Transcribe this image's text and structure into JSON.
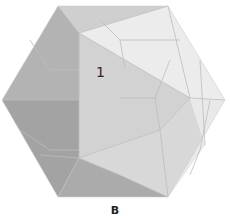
{
  "figure": {
    "shape": "icosahedron",
    "face_label": "1",
    "caption": "B",
    "colors": {
      "dark_face": "#a9a9a9",
      "darker_face": "#9e9e9e",
      "mid_face": "#c6c6c6",
      "light_face": "#d9d9d9",
      "lighter_face": "#e6e6e6",
      "lightest_face": "#f1f1f1",
      "edge": "#bdbdbd"
    }
  }
}
